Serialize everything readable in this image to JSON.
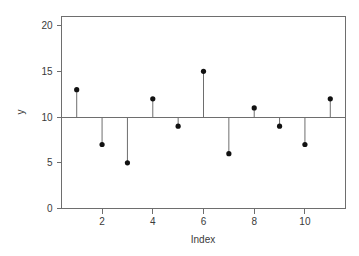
{
  "chart_data": {
    "type": "scatter",
    "title": "",
    "subtitle": "",
    "xlabel": "Index",
    "ylabel": "y",
    "x": [
      1,
      2,
      3,
      4,
      5,
      6,
      7,
      8,
      9,
      10,
      11
    ],
    "values": [
      13,
      7,
      5,
      12,
      9,
      15,
      6,
      11,
      9,
      7,
      12
    ],
    "baseline": 10,
    "xlim": [
      0.4,
      11.6
    ],
    "ylim": [
      0,
      21
    ],
    "xticks": [
      2,
      4,
      6,
      8,
      10
    ],
    "xtick_labels": [
      "2",
      "4",
      "6",
      "8",
      "10"
    ],
    "yticks": [
      0,
      5,
      10,
      15,
      20
    ],
    "ytick_labels": [
      "0",
      "5",
      "10",
      "15",
      "20"
    ],
    "grid": false,
    "legend": null,
    "legend_position": "none",
    "point_color": "#111111",
    "stem_color": "#6e6e6e",
    "axis_color": "#6e6e6e",
    "background_color": "#ffffff",
    "annotations": []
  },
  "axes": {
    "x_title": "Index",
    "y_title": "y"
  }
}
